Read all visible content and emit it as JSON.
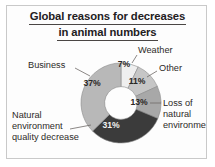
{
  "card": {
    "border_color": "#c9c9c9",
    "background": "#fdfdfd"
  },
  "title": {
    "line1": "Global reasons for decreases",
    "line2": "in animal numbers",
    "full": "Global reasons for decreases in animal numbers",
    "underlined": true,
    "color": "#23201e"
  },
  "chart_data": {
    "type": "pie",
    "variant": "donut",
    "title": "Global reasons for decreases in animal numbers",
    "xlabel": "",
    "ylabel": "",
    "units": "percent",
    "total": 99,
    "start_angle_deg": 0,
    "direction": "clockwise",
    "inner_radius_ratio": 0.41,
    "legend": "none",
    "grid": false,
    "categories": [
      "Weather",
      "Other",
      "Loss of natural environment",
      "Natural environment quality decrease",
      "Business"
    ],
    "values": [
      7,
      11,
      13,
      31,
      37
    ],
    "data_labels": [
      "7%",
      "11%",
      "13%",
      "31%",
      "37%"
    ],
    "colors": [
      "#efefef",
      "#c6c6c6",
      "#a8a8a8",
      "#3b3b3b",
      "#b8b8b8"
    ],
    "slices": [
      {
        "name": "Weather",
        "value": 7,
        "label": "7%",
        "color": "#efefef",
        "label_text_color": "#2a2725",
        "callout_label": "Weather",
        "callout_lines": [
          "Weather"
        ],
        "callout_position": "top-right"
      },
      {
        "name": "Other",
        "value": 11,
        "label": "11%",
        "color": "#c6c6c6",
        "label_text_color": "#2a2725",
        "callout_label": "Other",
        "callout_lines": [
          "Other"
        ],
        "callout_position": "right-upper"
      },
      {
        "name": "Loss of natural environment",
        "value": 13,
        "label": "13%",
        "color": "#a8a8a8",
        "label_text_color": "#2a2725",
        "callout_label": "Loss of natural environment",
        "callout_lines": [
          "Loss of",
          "natural",
          "environment"
        ],
        "callout_position": "right-lower"
      },
      {
        "name": "Natural environment quality decrease",
        "value": 31,
        "label": "31%",
        "color": "#3b3b3b",
        "label_text_color": "#f2f2f2",
        "callout_label": "Natural environment quality decrease",
        "callout_lines": [
          "Natural",
          "environment",
          "quality decrease"
        ],
        "callout_position": "left-lower"
      },
      {
        "name": "Business",
        "value": 37,
        "label": "37%",
        "color": "#b8b8b8",
        "label_text_color": "#2a2725",
        "callout_label": "Business",
        "callout_lines": [
          "Business"
        ],
        "callout_position": "left-upper"
      }
    ]
  }
}
